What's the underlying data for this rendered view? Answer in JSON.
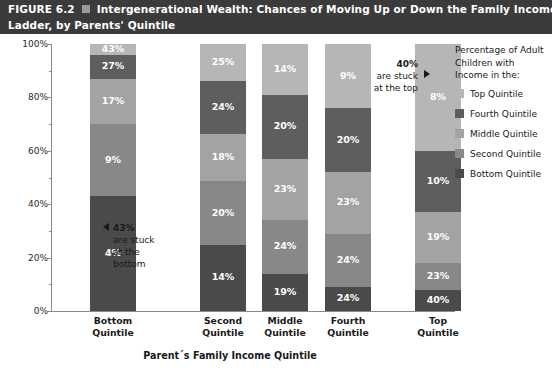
{
  "figure": {
    "number": "FIGURE 6.2",
    "marker_icon": "square-marker",
    "title_line1": "Intergenerational Wealth: Chances of Moving Up or Down the Family Income",
    "title_line2": "Ladder, by Parents' Quintile",
    "banner_color": "#3b3b3b"
  },
  "legend": {
    "title_line1": "Percentage of Adult",
    "title_line2": "Children with",
    "title_line3": "Income in the:",
    "items": [
      {
        "label": "Top Quintile",
        "color": "#b6b6b6"
      },
      {
        "label": "Fourth Quintile",
        "color": "#5e5e5e"
      },
      {
        "label": "Middle Quintile",
        "color": "#a3a3a3"
      },
      {
        "label": "Second Quintile",
        "color": "#888888"
      },
      {
        "label": "Bottom Quintile",
        "color": "#4a4a4a"
      }
    ]
  },
  "annotations": {
    "bottom": {
      "lead": "43%",
      "line2": "are stuck",
      "line3": "at the",
      "line4": "bottom",
      "arrow_icon": "left-triangle-icon"
    },
    "top": {
      "lead": "40%",
      "line2": "are stuck",
      "line3": "at the top",
      "arrow_icon": "right-triangle-icon"
    }
  },
  "axes": {
    "y_title": "Percentage of Adult Children in Each Family Income Quintile",
    "x_title": "Parent´s Family Income Quintile",
    "y_ticks": [
      "0%",
      "20%",
      "40%",
      "60%",
      "80%",
      "100%"
    ],
    "y_minor_ticks": [
      10,
      30,
      50,
      70,
      90
    ]
  },
  "chart_data": {
    "type": "bar",
    "stacked": true,
    "stack_total": 100,
    "title": "Intergenerational Wealth: Chances of Moving Up or Down the Family Income Ladder, by Parents' Quintile",
    "xlabel": "Parent´s Family Income Quintile",
    "ylabel": "Percentage of Adult Children in Each Family Income Quintile",
    "ylim": [
      0,
      100
    ],
    "grid": false,
    "legend_position": "right",
    "categories": [
      "Bottom Quintile",
      "Second Quintile",
      "Middle Quintile",
      "Fourth Quintile",
      "Top Quintile"
    ],
    "category_labels": [
      {
        "line1": "Bottom",
        "line2": "Quintile"
      },
      {
        "line1": "Second",
        "line2": "Quintile"
      },
      {
        "line1": "Middle",
        "line2": "Quintile"
      },
      {
        "line1": "Fourth",
        "line2": "Quintile"
      },
      {
        "line1": "Top",
        "line2": "Quintile"
      }
    ],
    "series": [
      {
        "name": "Bottom Quintile",
        "color": "#4a4a4a",
        "values": [
          43,
          25,
          14,
          9,
          8
        ]
      },
      {
        "name": "Second Quintile",
        "color": "#888888",
        "values": [
          27,
          24,
          20,
          20,
          10
        ]
      },
      {
        "name": "Middle Quintile",
        "color": "#a3a3a3",
        "values": [
          17,
          18,
          23,
          23,
          19
        ]
      },
      {
        "name": "Fourth Quintile",
        "color": "#5e5e5e",
        "values": [
          9,
          20,
          24,
          24,
          23
        ]
      },
      {
        "name": "Top Quintile",
        "color": "#b6b6b6",
        "values": [
          4,
          14,
          19,
          24,
          40
        ]
      }
    ],
    "bar_labels": [
      [
        "4%",
        "9%",
        "17%",
        "27%",
        "43%"
      ],
      [
        "14%",
        "20%",
        "18%",
        "24%",
        "25%"
      ],
      [
        "19%",
        "24%",
        "23%",
        "20%",
        "14%"
      ],
      [
        "24%",
        "24%",
        "23%",
        "20%",
        "9%"
      ],
      [
        "40%",
        "23%",
        "19%",
        "10%",
        "8%"
      ]
    ]
  }
}
